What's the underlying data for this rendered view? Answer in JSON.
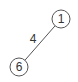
{
  "graph": {
    "nodes": [
      {
        "id": "1",
        "label": "1"
      },
      {
        "id": "6",
        "label": "6"
      }
    ],
    "edges": [
      {
        "from": "1",
        "to": "6",
        "label": "4"
      }
    ],
    "colors": {
      "stroke": "#555555",
      "text": "#333333",
      "background": "#ffffff"
    }
  }
}
